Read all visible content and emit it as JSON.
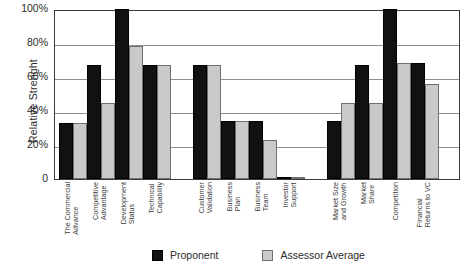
{
  "chart_data": {
    "type": "bar",
    "title": "",
    "subtitle": "",
    "xlabel": "",
    "ylabel": "Relative Strenght",
    "ylim": [
      0,
      100
    ],
    "grid": true,
    "legend_position": "bottom",
    "yticks": [
      "0",
      "20%",
      "40%",
      "60%",
      "80%",
      "100%"
    ],
    "ytick_values": [
      0,
      20,
      40,
      60,
      80,
      100
    ],
    "categories": [
      "The Commercial Advance",
      "Competitive Advantage",
      "Development Status",
      "Technical Capability",
      "Customer Validation",
      "Business Plan",
      "Business Team",
      "Investor Support",
      "Market Size and Growth",
      "Market Share",
      "Competition",
      "Financial Returns to VC"
    ],
    "category_lines": [
      [
        "The Commercial",
        "Advance"
      ],
      [
        "Competitive",
        "Advantage"
      ],
      [
        "Development",
        "Status"
      ],
      [
        "Technical",
        "Capability"
      ],
      [
        "Customer",
        "Validation"
      ],
      [
        "Business",
        "Plan"
      ],
      [
        "Business",
        "Team"
      ],
      [
        "Investor",
        "Support"
      ],
      [
        "Market Size",
        "and Growth"
      ],
      [
        "Market",
        "Share"
      ],
      [
        "Competition",
        ""
      ],
      [
        "Financial",
        "Returns to VC"
      ]
    ],
    "groups": [
      {
        "name": "Technology",
        "category_indices": [
          0,
          1,
          2,
          3
        ]
      },
      {
        "name": "Business",
        "category_indices": [
          4,
          5,
          6,
          7
        ]
      },
      {
        "name": "Market",
        "category_indices": [
          8,
          9,
          10,
          11
        ]
      }
    ],
    "series": [
      {
        "name": "Proponent",
        "color": "#111111",
        "values": [
          33,
          67,
          100,
          67,
          67,
          34,
          34,
          1,
          34,
          67,
          100,
          68
        ]
      },
      {
        "name": "Assessor Average",
        "color": "#c9c9c9",
        "values": [
          33,
          45,
          78,
          67,
          67,
          34,
          23,
          1,
          45,
          45,
          68,
          56
        ]
      }
    ]
  },
  "legend": {
    "items": [
      {
        "label": "Proponent",
        "color": "#111111"
      },
      {
        "label": "Assessor Average",
        "color": "#c9c9c9"
      }
    ]
  }
}
